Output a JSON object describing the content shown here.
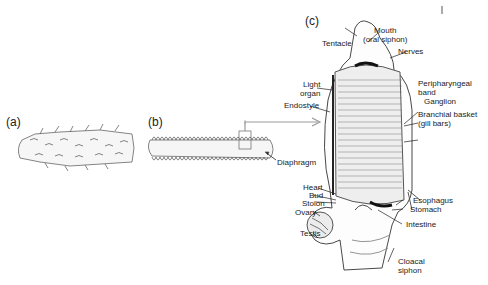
{
  "figure": {
    "panels": {
      "a": "(a)",
      "b": "(b)",
      "c": "(c)"
    },
    "panel_b_labels": {
      "diaphragm": "Diaphragm"
    },
    "panel_c_labels": {
      "tentacle": "Tentacle",
      "mouth_line1": "Mouth",
      "mouth_line2": "(oral siphon)",
      "nerves": "Nerves",
      "light_line1": "Light",
      "light_line2": "organ",
      "endostyle": "Endostyle",
      "peri_line1": "Peripharyngeal",
      "peri_line2": "band",
      "ganglion": "Ganglion",
      "branch_line1": "Branchial basket",
      "branch_line2": "(gill bars)",
      "heart": "Heart",
      "bud": "Bud",
      "stolon": "Stolon",
      "ovary": "Ovary",
      "testis": "Testis",
      "esophagus": "Esophagus",
      "stomach": "Stomach",
      "intestine": "Intestine",
      "cloacal_line1": "Cloacal",
      "cloacal_line2": "siphon"
    }
  }
}
